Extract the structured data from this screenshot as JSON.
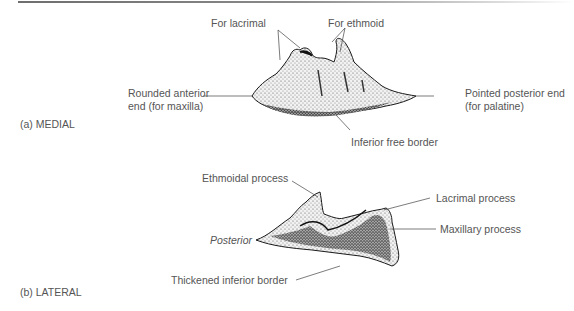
{
  "figure": {
    "panels": [
      {
        "id": "a",
        "caption": "(a) MEDIAL",
        "labels": {
          "for_lacrimal": "For lacrimal",
          "for_ethmoid": "For ethmoid",
          "anterior_line1": "Rounded anterior",
          "anterior_line2": "end (for maxilla)",
          "posterior_line1": "Pointed posterior end",
          "posterior_line2": "(for palatine)",
          "inferior": "Inferior free border"
        }
      },
      {
        "id": "b",
        "caption": "(b) LATERAL",
        "labels": {
          "ethmoidal_process": "Ethmoidal process",
          "lacrimal_process": "Lacrimal process",
          "maxillary_process": "Maxillary process",
          "posterior": "Posterior",
          "thickened_border": "Thickened inferior border"
        }
      }
    ]
  },
  "colors": {
    "text": "#555555",
    "leader": "#444444",
    "bone_outline": "#1a1a1a",
    "bone_fill": "#ececec",
    "bone_shade": "#3a3a3a"
  }
}
